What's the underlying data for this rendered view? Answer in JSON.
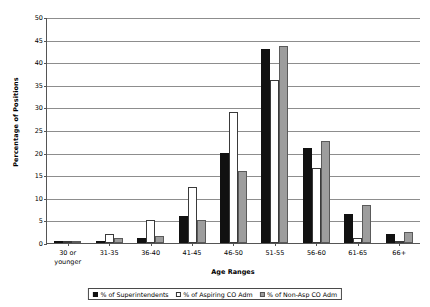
{
  "chart_data": {
    "type": "bar",
    "title": "",
    "xlabel": "Age Ranges",
    "ylabel": "Percentage of Positions",
    "ylim": [
      0,
      50
    ],
    "ytick_step": 5,
    "yticks": [
      "0",
      "5",
      "10",
      "15",
      "20",
      "25",
      "30",
      "35",
      "40",
      "45",
      "50"
    ],
    "grid": true,
    "legend_position": "bottom",
    "categories": [
      "30 or\nyounger",
      "31-35",
      "36-40",
      "41-45",
      "46-50",
      "51-55",
      "56-60",
      "61-65",
      "66+"
    ],
    "series": [
      {
        "name": "% of Superintendents",
        "color": "#111111",
        "values": [
          0.2,
          0.5,
          1.0,
          6.0,
          20.0,
          43.0,
          21.0,
          6.5,
          2.0
        ]
      },
      {
        "name": "% of Aspiring CO Adm",
        "color": "#ffffff",
        "values": [
          0.3,
          2.0,
          5.0,
          12.5,
          29.0,
          36.0,
          16.5,
          1.0,
          0.0
        ]
      },
      {
        "name": "% of Non-Asp CO Adm",
        "color": "#9d9d9d",
        "values": [
          0.2,
          1.0,
          1.5,
          5.0,
          16.0,
          43.5,
          22.5,
          8.5,
          2.5
        ]
      }
    ]
  }
}
